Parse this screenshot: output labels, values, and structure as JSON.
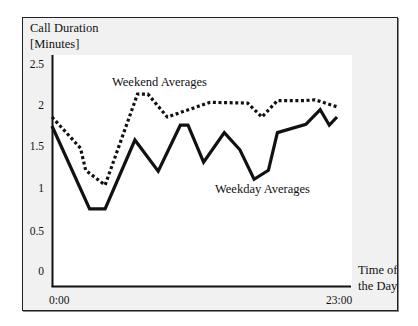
{
  "chart_data": {
    "type": "line",
    "title": "",
    "ylabel": "Call Duration [Minutes]",
    "ylabel_lines": [
      "Call Duration",
      "[Minutes]"
    ],
    "xlabel": "Time of the Day",
    "xlabel_lines": [
      "Time of",
      "the Day"
    ],
    "ylim": [
      0,
      2.5
    ],
    "xlim": [
      0,
      23
    ],
    "x_unit": "hours",
    "yticks": [
      "2.5",
      "2",
      "1.5",
      "1",
      "0.5",
      "0"
    ],
    "ytick_values": [
      2.5,
      2,
      1.5,
      1,
      0.5,
      0
    ],
    "xticks": [
      "0:00",
      "23:00"
    ],
    "grid": false,
    "legend": "inline annotations",
    "series": [
      {
        "name": "Weekend Averages",
        "style": "dotted",
        "color": "#111111",
        "x": [
          0,
          2.2,
          2.6,
          4.1,
          6.6,
          7.4,
          8.9,
          12.2,
          15.1,
          16.2,
          17.4,
          19.5,
          20.3,
          22.1
        ],
        "values": [
          1.89,
          1.51,
          1.24,
          1.06,
          2.17,
          2.17,
          1.89,
          2.07,
          2.06,
          1.89,
          2.09,
          2.09,
          2.1,
          2.01
        ]
      },
      {
        "name": "Weekday Averages",
        "style": "solid",
        "color": "#111111",
        "x": [
          0,
          2.9,
          4.1,
          6.4,
          8.2,
          9.9,
          10.5,
          11.7,
          13.3,
          14.5,
          15.6,
          16.7,
          17.4,
          19.6,
          20.7,
          21.4,
          22.0
        ],
        "values": [
          1.78,
          0.77,
          0.77,
          1.61,
          1.23,
          1.79,
          1.79,
          1.34,
          1.7,
          1.49,
          1.13,
          1.24,
          1.7,
          1.8,
          1.98,
          1.79,
          1.89
        ]
      }
    ]
  }
}
